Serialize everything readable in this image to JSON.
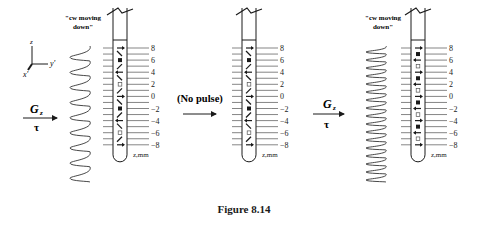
{
  "figure": {
    "caption": "Figure 8.14",
    "axes": {
      "z_label": "z",
      "x_label": "x'",
      "y_label": "y'"
    },
    "arrows": [
      {
        "id": "gz-1",
        "top_label": "G",
        "subscript": "z",
        "bottom_label": "τ"
      },
      {
        "id": "no-pulse",
        "top_label": "(No pulse)",
        "bottom_label": ""
      },
      {
        "id": "gz-2",
        "top_label": "G",
        "subscript": "z",
        "bottom_label": "τ"
      }
    ],
    "panels": [
      {
        "id": "panel-1",
        "helix_label_line1": "\"cw moving",
        "helix_label_line2": "down\"",
        "helix_turns": 9,
        "axis_unit": "z,mm",
        "tick_labels": [
          "8",
          "6",
          "4",
          "2",
          "0",
          "−2",
          "−4",
          "−6",
          "−8"
        ],
        "symbols": [
          "right",
          "diag-down",
          "filled",
          "diag-up",
          "left",
          "diag-down",
          "open",
          "diag-up",
          "right",
          "diag-down",
          "filled",
          "diag-up",
          "left",
          "diag-down",
          "open",
          "diag-up",
          "right"
        ]
      },
      {
        "id": "panel-2",
        "helix_label_line1": "",
        "helix_label_line2": "",
        "helix_turns": 0,
        "axis_unit": "z,mm",
        "tick_labels": [
          "8",
          "6",
          "4",
          "2",
          "0",
          "−2",
          "−4",
          "−6",
          "−8"
        ],
        "symbols": [
          "right",
          "diag-down",
          "filled",
          "diag-up",
          "left",
          "diag-down",
          "open",
          "diag-up",
          "right",
          "diag-down",
          "filled",
          "diag-up",
          "left",
          "diag-down",
          "open",
          "diag-up",
          "right"
        ]
      },
      {
        "id": "panel-3",
        "helix_label_line1": "\"cw moving",
        "helix_label_line2": "down\"",
        "helix_turns": 17,
        "axis_unit": "z,mm",
        "tick_labels": [
          "8",
          "6",
          "4",
          "2",
          "0",
          "−2",
          "−4",
          "−6",
          "−8"
        ],
        "symbols": [
          "right",
          "filled",
          "left",
          "open",
          "right",
          "filled",
          "left",
          "open",
          "right",
          "filled",
          "left",
          "open",
          "right",
          "filled",
          "left",
          "open",
          "right"
        ]
      }
    ]
  }
}
